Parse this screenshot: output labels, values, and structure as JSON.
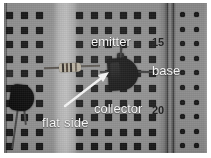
{
  "image": {
    "subject": "breadboard-transistor-photo",
    "description": "Close-up grayscale photograph of a solderless breadboard with a TO-92 transistor and a resistor, annotated with white text labels and a white arrow.",
    "background_color": "#ffffff",
    "board_color": "#8d8d8d",
    "hole_color": "#1d1d1d"
  },
  "annotations": {
    "emitter": "emitter",
    "base": "base",
    "collector": "collector",
    "flat_side": "flat side",
    "label_color": "#f4f4f4",
    "arrow_color": "#f0f0f0"
  },
  "board_markings": {
    "row_15": "15",
    "row_20": "20",
    "marking_color": "#262626"
  },
  "components": {
    "transistor": {
      "name": "TO-92 transistor",
      "color": "#131313",
      "leads": [
        "emitter",
        "base",
        "collector"
      ]
    },
    "resistor": {
      "name": "resistor",
      "body_color": "#b4ad9d",
      "band_color": "#2c2722"
    },
    "transistor_left": {
      "name": "second transistor",
      "color": "#101010"
    }
  }
}
